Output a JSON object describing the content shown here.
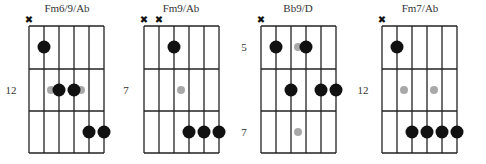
{
  "diagram": {
    "string_spacing": 15,
    "grid_width": 75,
    "grid_top": 26,
    "fret_ys": [
      26,
      69,
      111,
      153
    ],
    "dot_ys": [
      47,
      90,
      132
    ],
    "colors": {
      "dot": "#111111",
      "ghost": "#a8a8a8",
      "line": "#222222"
    },
    "chords": [
      {
        "name": "Fm6/9/Ab",
        "grid_left": 29,
        "title_x": 67,
        "fret_labels": [
          {
            "text": "12",
            "x": 11,
            "y": 90
          }
        ],
        "muted_strings": [
          1
        ],
        "dots": [
          {
            "string": 2,
            "fret": 1,
            "type": "fingered"
          },
          {
            "string": 3,
            "fret": 2,
            "type": "fingered"
          },
          {
            "string": 4,
            "fret": 2,
            "type": "fingered"
          },
          {
            "string": 5,
            "fret": 3,
            "type": "fingered"
          },
          {
            "string": 6,
            "fret": 3,
            "type": "fingered"
          }
        ],
        "ghosts": [
          {
            "x_offset": 22,
            "fret": 2
          },
          {
            "x_offset": 52,
            "fret": 2
          }
        ]
      },
      {
        "name": "Fm9/Ab",
        "grid_left": 144,
        "title_x": 181,
        "fret_labels": [
          {
            "text": "7",
            "x": 126,
            "y": 90
          }
        ],
        "muted_strings": [
          1,
          2
        ],
        "dots": [
          {
            "string": 3,
            "fret": 1,
            "type": "fingered"
          },
          {
            "string": 4,
            "fret": 3,
            "type": "fingered"
          },
          {
            "string": 5,
            "fret": 3,
            "type": "fingered"
          },
          {
            "string": 6,
            "fret": 3,
            "type": "fingered"
          }
        ],
        "ghosts": [
          {
            "x_offset": 37,
            "fret": 2
          }
        ]
      },
      {
        "name": "Bb9/D",
        "grid_left": 261,
        "title_x": 298,
        "fret_labels": [
          {
            "text": "5",
            "x": 244,
            "y": 47
          },
          {
            "text": "7",
            "x": 244,
            "y": 132
          }
        ],
        "muted_strings": [
          1
        ],
        "dots": [
          {
            "string": 2,
            "fret": 1,
            "type": "fingered"
          },
          {
            "string": 4,
            "fret": 1,
            "type": "fingered"
          },
          {
            "string": 3,
            "fret": 2,
            "type": "fingered"
          },
          {
            "string": 5,
            "fret": 2,
            "type": "fingered"
          },
          {
            "string": 6,
            "fret": 2,
            "type": "fingered"
          }
        ],
        "ghosts": [
          {
            "x_offset": 37,
            "fret": 1
          },
          {
            "x_offset": 37,
            "fret": 3
          }
        ]
      },
      {
        "name": "Fm7/Ab",
        "grid_left": 382,
        "title_x": 420,
        "fret_labels": [
          {
            "text": "12",
            "x": 363,
            "y": 90
          }
        ],
        "muted_strings": [
          1
        ],
        "dots": [
          {
            "string": 2,
            "fret": 1,
            "type": "fingered"
          },
          {
            "string": 3,
            "fret": 3,
            "type": "fingered"
          },
          {
            "string": 4,
            "fret": 3,
            "type": "fingered"
          },
          {
            "string": 5,
            "fret": 3,
            "type": "fingered"
          },
          {
            "string": 6,
            "fret": 3,
            "type": "fingered"
          }
        ],
        "ghosts": [
          {
            "x_offset": 22,
            "fret": 2
          },
          {
            "x_offset": 52,
            "fret": 2
          }
        ]
      }
    ]
  },
  "icons": {
    "mute": "✖"
  }
}
